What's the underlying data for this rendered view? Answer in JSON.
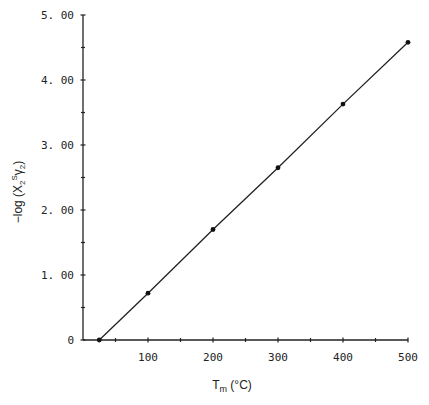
{
  "chart_data": {
    "type": "line",
    "title": "",
    "xlabel": "T_m (°C)",
    "xlabel_main": "T",
    "xlabel_sub": "m",
    "xlabel_unit": " (°C)",
    "ylabel": "−log (X2Sγ2)",
    "ylabel_parts": {
      "prefix": "−log (X",
      "sub": "2",
      "sup": "S",
      "gamma": "γ",
      "gamma_sub": "2",
      "suffix": ")"
    },
    "xlim": [
      0,
      500
    ],
    "ylim": [
      0,
      5
    ],
    "x_ticks": [
      100,
      200,
      300,
      400,
      500
    ],
    "x_tick_labels": [
      "100",
      "200",
      "300",
      "400",
      "500"
    ],
    "x_minor_ticks": [
      50,
      150,
      250,
      350,
      450
    ],
    "y_ticks": [
      0,
      1,
      2,
      3,
      4,
      5
    ],
    "y_tick_labels": [
      "0",
      "1. 00",
      "2. 00",
      "3. 00",
      "4. 00",
      "5. 00"
    ],
    "y_minor_ticks": [
      0.5,
      1.5,
      2.5,
      3.5,
      4.5
    ],
    "grid": false,
    "legend": null,
    "series": [
      {
        "name": "-log(X2S gamma2) vs Tm",
        "x": [
          25,
          100,
          200,
          300,
          400,
          500
        ],
        "y": [
          0.0,
          0.72,
          1.7,
          2.65,
          3.63,
          4.58
        ],
        "markers": true,
        "color": "#222222"
      }
    ]
  }
}
